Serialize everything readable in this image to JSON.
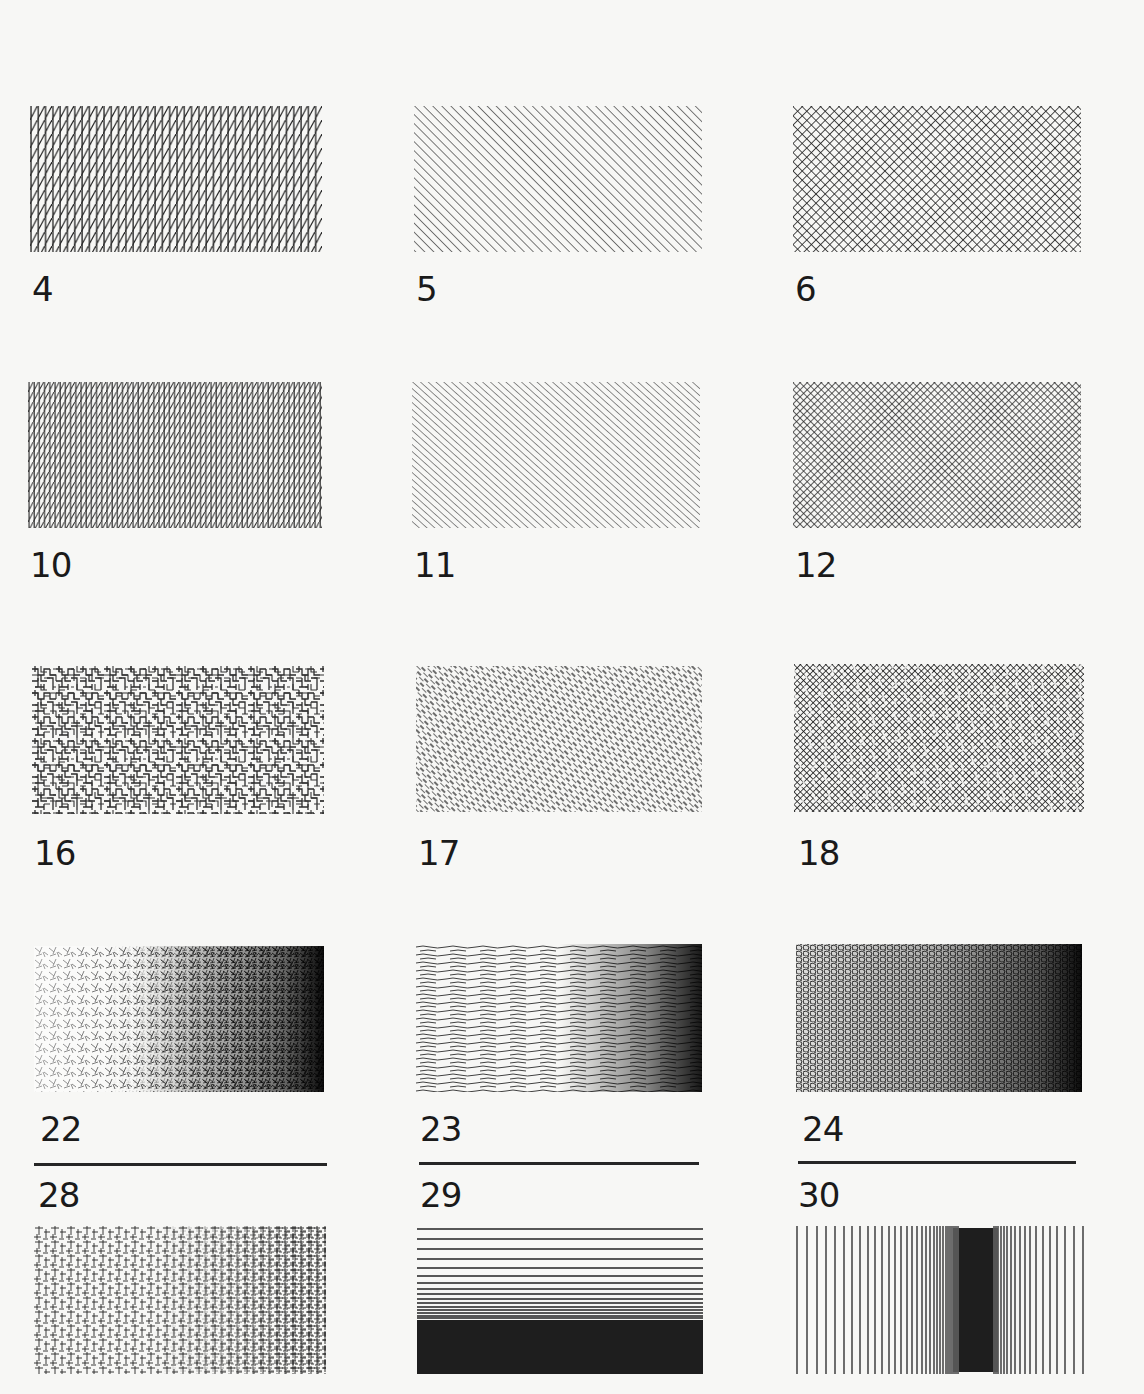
{
  "page": {
    "background": "#f7f7f5",
    "ink": "#1a1a1a"
  },
  "samples": [
    {
      "id": "4",
      "label": "4",
      "pattern": "vertical lines with diagonal hatching"
    },
    {
      "id": "5",
      "label": "5",
      "pattern": "diagonal hatching"
    },
    {
      "id": "6",
      "label": "6",
      "pattern": "diagonal cross-hatching"
    },
    {
      "id": "10",
      "label": "10",
      "pattern": "dense vertical + diagonal hatching"
    },
    {
      "id": "11",
      "label": "11",
      "pattern": "diagonal hatching, fine"
    },
    {
      "id": "12",
      "label": "12",
      "pattern": "dense diagonal cross-hatching"
    },
    {
      "id": "16",
      "label": "16",
      "pattern": "random orthogonal maze strokes"
    },
    {
      "id": "17",
      "label": "17",
      "pattern": "random diagonal dash strokes"
    },
    {
      "id": "18",
      "label": "18",
      "pattern": "random diagonal maze strokes"
    },
    {
      "id": "22",
      "label": "22",
      "pattern": "random strokes, gradient light to dark (left to right)"
    },
    {
      "id": "23",
      "label": "23",
      "pattern": "horizontal wavy strokes, gradient to dark right"
    },
    {
      "id": "24",
      "label": "24",
      "pattern": "random cells, gradient to dark right"
    },
    {
      "id": "28",
      "label": "28",
      "pattern": "orthogonal random strokes, gradient to dark right"
    },
    {
      "id": "29",
      "label": "29",
      "pattern": "horizontal lines converging to solid at bottom"
    },
    {
      "id": "30",
      "label": "30",
      "pattern": "vertical lines converging to solid band right of center"
    }
  ]
}
